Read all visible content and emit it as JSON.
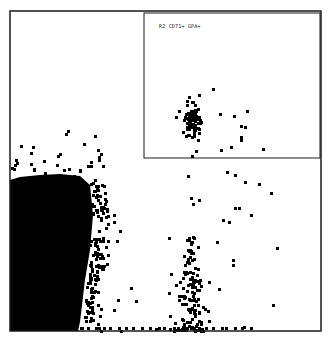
{
  "chart_data": {
    "type": "scatter",
    "title": "",
    "xlabel": "",
    "ylabel": "",
    "grid": false,
    "legend": null,
    "frame": {
      "x": 10,
      "y": 11,
      "w": 311,
      "h": 320
    },
    "colors": {
      "points": "#000000",
      "frame": "#1a1a1a",
      "background": "#ffffff"
    },
    "inset": {
      "label": "R2 CD71+ GPA+",
      "frame": {
        "x": 144,
        "y": 13,
        "w": 176,
        "h": 145
      },
      "cluster": {
        "cx": 191,
        "cy": 120,
        "sx": 4,
        "sy": 11,
        "n": 90
      },
      "outliers": [
        [
          212,
          88
        ],
        [
          178,
          110
        ],
        [
          219,
          113
        ],
        [
          233,
          115
        ],
        [
          246,
          110
        ],
        [
          240,
          125
        ],
        [
          220,
          149
        ],
        [
          244,
          126
        ],
        [
          230,
          146
        ],
        [
          240,
          139
        ],
        [
          240,
          136
        ],
        [
          262,
          148
        ],
        [
          195,
          150
        ]
      ]
    },
    "main_population": {
      "description": "Dense negative population, lower-left",
      "solid_region": [
        [
          10,
          180
        ],
        [
          20,
          177
        ],
        [
          40,
          175
        ],
        [
          60,
          174
        ],
        [
          80,
          176
        ],
        [
          90,
          185
        ],
        [
          93,
          215
        ],
        [
          90,
          250
        ],
        [
          85,
          280
        ],
        [
          82,
          305
        ],
        [
          80,
          322
        ],
        [
          78,
          331
        ],
        [
          10,
          331
        ]
      ],
      "scatter_edge_points": 220
    },
    "secondary_population": {
      "description": "Vertical stalk population near x≈190",
      "cx": 190,
      "base_y": 330,
      "top_y": 235,
      "n": 140
    },
    "sparse_points": [
      [
        187,
        175
      ],
      [
        226,
        171
      ],
      [
        234,
        174
      ],
      [
        244,
        181
      ],
      [
        258,
        183
      ],
      [
        270,
        192
      ],
      [
        190,
        197
      ],
      [
        198,
        199
      ],
      [
        192,
        203
      ],
      [
        234,
        207
      ],
      [
        238,
        207
      ],
      [
        222,
        219
      ],
      [
        228,
        221
      ],
      [
        250,
        214
      ],
      [
        216,
        241
      ],
      [
        276,
        247
      ],
      [
        232,
        259
      ],
      [
        232,
        264
      ],
      [
        208,
        281
      ],
      [
        218,
        288
      ],
      [
        272,
        304
      ],
      [
        195,
        325
      ],
      [
        243,
        326
      ],
      [
        168,
        237
      ],
      [
        130,
        287
      ],
      [
        117,
        299
      ],
      [
        135,
        300
      ],
      [
        113,
        309
      ],
      [
        155,
        328
      ],
      [
        120,
        330
      ],
      [
        100,
        330
      ]
    ]
  }
}
